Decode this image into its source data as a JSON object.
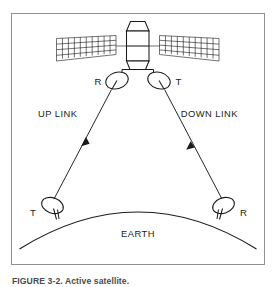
{
  "figure": {
    "caption": "FIGURE 3-2.  Active satellite.",
    "frame_color": "#8f9193",
    "ink_color": "#1b1b1b",
    "background": "#ffffff"
  },
  "diagram": {
    "title_subject": "satellite-communications-link",
    "labels": {
      "up_link": "UP LINK",
      "down_link": "DOWN LINK",
      "earth": "EARTH",
      "satellite_receive": "R",
      "satellite_transmit": "T",
      "ground_transmit": "T",
      "ground_receive": "R"
    },
    "parts": {
      "satellite_body": "satellite-bus",
      "solar_panel_left": "solar-panel-left",
      "solar_panel_right": "solar-panel-right",
      "dish_satellite_left": "satellite-receive-dish",
      "dish_satellite_right": "satellite-transmit-dish",
      "dish_ground_left": "ground-transmit-dish",
      "dish_ground_right": "ground-receive-dish",
      "earth_surface": "earth-arc",
      "beam_up": "uplink-beam",
      "beam_down": "downlink-beam"
    },
    "solar_panel_grid": {
      "columns": 10,
      "rows": 4
    }
  }
}
